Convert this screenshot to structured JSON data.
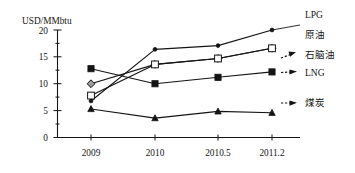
{
  "chart_data": {
    "type": "line",
    "title": "",
    "subtitle": "",
    "xlabel": "",
    "ylabel": "USD/MMbtu",
    "x": [
      "2009",
      "2010",
      "2010.5",
      "2011.2"
    ],
    "categories": [
      "2009",
      "2010",
      "2010.5",
      "2011.2"
    ],
    "xtick_labels": [
      "2009",
      "2010",
      "2010.5",
      "2011.2"
    ],
    "ytick_labels": [
      "0",
      "5",
      "10",
      "15",
      "20"
    ],
    "ytick_values": [
      0,
      5,
      10,
      15,
      20
    ],
    "ylim": [
      0,
      20
    ],
    "grid": false,
    "legend_position": "right",
    "series": [
      {
        "name": "LPG",
        "marker": "dot",
        "values": [
          6.8,
          16.4,
          17.1,
          20.0
        ]
      },
      {
        "name": "原油",
        "marker": "gray-diamond",
        "values": [
          10.0,
          13.6,
          14.7,
          16.6
        ]
      },
      {
        "name": "石脑油",
        "marker": "open-square",
        "values": [
          7.8,
          13.6,
          14.7,
          16.6
        ]
      },
      {
        "name": "LNG",
        "marker": "filled-square",
        "values": [
          12.8,
          10.0,
          11.2,
          12.2
        ]
      },
      {
        "name": "煤炭",
        "marker": "filled-triangle",
        "values": [
          5.3,
          3.6,
          4.85,
          4.6
        ]
      }
    ]
  },
  "axis": {
    "y_axis_title": "USD/MMbtu",
    "y_ticks": [
      "20",
      "15",
      "10",
      "5",
      "0"
    ],
    "x_ticks": [
      "2009",
      "2010",
      "2010.5",
      "2011.2"
    ]
  },
  "legend": {
    "items": [
      {
        "label": "LPG",
        "has_arrow": false
      },
      {
        "label": "原油",
        "has_arrow": true
      },
      {
        "label": "石脑油",
        "has_arrow": false
      },
      {
        "label": "LNG",
        "has_arrow": true
      },
      {
        "label": "煤炭",
        "has_arrow": true
      }
    ]
  },
  "colors": {
    "ink": "#141414",
    "marker_gray": "#9c9c9c",
    "background": "#ffffff"
  }
}
